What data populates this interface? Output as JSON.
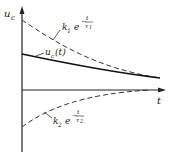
{
  "diagram": {
    "y_axis_label": "u",
    "y_axis_sub": "c",
    "x_axis_label": "t",
    "curves": [
      {
        "name": "k1-exp-curve",
        "style": "dashed",
        "label_k": "k",
        "label_k_sub": "1",
        "label_e": "e",
        "exp_num": "t",
        "exp_den": "τ",
        "exp_den_sub": "1"
      },
      {
        "name": "uc-total-curve",
        "style": "solid",
        "label": "u",
        "label_sub": "c",
        "label_arg": "(t)"
      },
      {
        "name": "k2-exp-curve",
        "style": "dashed",
        "label_k": "k",
        "label_k_sub": "2",
        "label_e": "e",
        "exp_num": "t",
        "exp_den": "τ",
        "exp_den_sub": "2"
      }
    ],
    "colors": {
      "line": "#222222",
      "background": "#ffffff"
    }
  }
}
